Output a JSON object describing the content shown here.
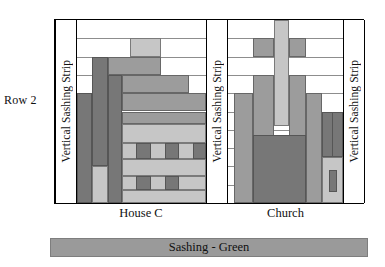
{
  "row": {
    "label": "Row 2"
  },
  "sashing_strips": [
    {
      "name": "left",
      "label": "Vertical Sashing Strip"
    },
    {
      "name": "middle",
      "label": "Vertical Sashing Strip"
    },
    {
      "name": "right",
      "label": "Vertical Sashing Strip"
    }
  ],
  "blocks": [
    {
      "name": "house-c",
      "caption": "House C"
    },
    {
      "name": "church",
      "caption": "Church"
    }
  ],
  "bottom_sashing": {
    "label": "Sashing - Green",
    "color": "#9a9a9a"
  },
  "colors": {
    "dark": "#777777",
    "medium": "#9c9c9c",
    "light": "#c6c6c6",
    "white": "#ffffff",
    "outline": "#000000",
    "grid": "#8d8d8d",
    "text": "#111111"
  },
  "chart_data": {
    "type": "table",
    "grid_rows": 10,
    "gridline_y_fractions": [
      0.0,
      0.1,
      0.2,
      0.3,
      0.4,
      0.5,
      0.6,
      0.7,
      0.8,
      0.9,
      1.0
    ],
    "house_c_patches": [
      {
        "id": "roof-peak",
        "shade": "light",
        "x": 0.41,
        "y": 0.1,
        "w": 0.24,
        "h": 0.1
      },
      {
        "id": "roof-upper",
        "shade": "medium",
        "x": 0.24,
        "y": 0.2,
        "w": 0.41,
        "h": 0.1
      },
      {
        "id": "roof-lower",
        "shade": "medium",
        "x": 0.35,
        "y": 0.3,
        "w": 0.52,
        "h": 0.1
      },
      {
        "id": "chimney-left",
        "shade": "dark",
        "x": 0.12,
        "y": 0.2,
        "w": 0.12,
        "h": 0.6
      },
      {
        "id": "wall-left",
        "shade": "dark",
        "x": 0.0,
        "y": 0.4,
        "w": 0.12,
        "h": 0.6
      },
      {
        "id": "wall-left-light",
        "shade": "light",
        "x": 0.12,
        "y": 0.8,
        "w": 0.12,
        "h": 0.2
      },
      {
        "id": "wall-mid-dark",
        "shade": "dark",
        "x": 0.24,
        "y": 0.3,
        "w": 0.11,
        "h": 0.7
      },
      {
        "id": "facade-band-1",
        "shade": "medium",
        "x": 0.35,
        "y": 0.4,
        "w": 0.65,
        "h": 0.1
      },
      {
        "id": "facade-band-2",
        "shade": "medium",
        "x": 0.35,
        "y": 0.5,
        "w": 0.65,
        "h": 0.07
      },
      {
        "id": "facade-band-3",
        "shade": "light",
        "x": 0.35,
        "y": 0.57,
        "w": 0.65,
        "h": 0.1
      },
      {
        "id": "window-row-1-bg",
        "shade": "light",
        "x": 0.35,
        "y": 0.67,
        "w": 0.65,
        "h": 0.09
      },
      {
        "id": "window-1a",
        "shade": "dark",
        "x": 0.46,
        "y": 0.67,
        "w": 0.11,
        "h": 0.09
      },
      {
        "id": "window-1b",
        "shade": "dark",
        "x": 0.68,
        "y": 0.67,
        "w": 0.11,
        "h": 0.09
      },
      {
        "id": "window-1c",
        "shade": "dark",
        "x": 0.9,
        "y": 0.67,
        "w": 0.1,
        "h": 0.09
      },
      {
        "id": "facade-band-4",
        "shade": "light",
        "x": 0.35,
        "y": 0.76,
        "w": 0.65,
        "h": 0.09
      },
      {
        "id": "window-row-2-bg",
        "shade": "light",
        "x": 0.35,
        "y": 0.85,
        "w": 0.65,
        "h": 0.08
      },
      {
        "id": "window-2a",
        "shade": "dark",
        "x": 0.46,
        "y": 0.85,
        "w": 0.11,
        "h": 0.08
      },
      {
        "id": "window-2b",
        "shade": "dark",
        "x": 0.68,
        "y": 0.85,
        "w": 0.11,
        "h": 0.08
      },
      {
        "id": "foundation",
        "shade": "light",
        "x": 0.35,
        "y": 0.93,
        "w": 0.65,
        "h": 0.07
      }
    ],
    "church_patches": [
      {
        "id": "steeple-spire",
        "shade": "light",
        "x": 0.4,
        "y": 0.0,
        "w": 0.13,
        "h": 0.58
      },
      {
        "id": "cross-arm-left",
        "shade": "medium",
        "x": 0.22,
        "y": 0.1,
        "w": 0.18,
        "h": 0.1
      },
      {
        "id": "cross-arm-right",
        "shade": "medium",
        "x": 0.53,
        "y": 0.1,
        "w": 0.15,
        "h": 0.1
      },
      {
        "id": "tower-left",
        "shade": "medium",
        "x": 0.22,
        "y": 0.3,
        "w": 0.18,
        "h": 0.7
      },
      {
        "id": "tower-right",
        "shade": "medium",
        "x": 0.53,
        "y": 0.3,
        "w": 0.15,
        "h": 0.7
      },
      {
        "id": "nave-left-wall",
        "shade": "medium",
        "x": 0.05,
        "y": 0.4,
        "w": 0.17,
        "h": 0.6
      },
      {
        "id": "nave-right-wall",
        "shade": "medium",
        "x": 0.68,
        "y": 0.4,
        "w": 0.14,
        "h": 0.6
      },
      {
        "id": "door-block",
        "shade": "dark",
        "x": 0.22,
        "y": 0.63,
        "w": 0.46,
        "h": 0.37
      },
      {
        "id": "annex-upper",
        "shade": "dark",
        "x": 0.82,
        "y": 0.5,
        "w": 0.18,
        "h": 0.25
      },
      {
        "id": "annex-upper-2",
        "shade": "dark",
        "x": 0.82,
        "y": 0.5,
        "w": 0.09,
        "h": 0.25
      },
      {
        "id": "annex-lower-bg",
        "shade": "light",
        "x": 0.82,
        "y": 0.75,
        "w": 0.18,
        "h": 0.25
      },
      {
        "id": "annex-window",
        "shade": "dark",
        "x": 0.88,
        "y": 0.82,
        "w": 0.07,
        "h": 0.12
      }
    ]
  }
}
